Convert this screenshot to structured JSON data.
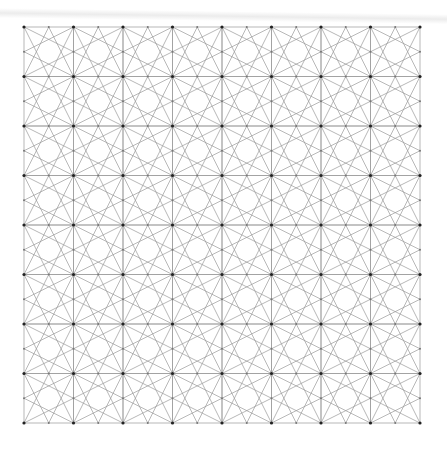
{
  "figure": {
    "grid": {
      "origin_x": 24,
      "origin_y": 27,
      "cell_size": 49.5,
      "cols": 8,
      "rows": 8
    },
    "colors": {
      "background": "#ffffff",
      "line": "#9a9a9a",
      "node": "#222222",
      "midpoint_node": "#777777"
    },
    "stroke_width": 0.7,
    "node_radius": 1.6,
    "midpoint_radius": 1.0
  }
}
